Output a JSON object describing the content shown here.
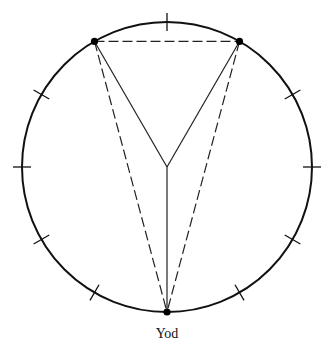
{
  "diagram": {
    "type": "circle-with-inscribed-yod",
    "circle": {
      "cx": 167,
      "cy": 167,
      "r": 145,
      "stroke": "#111111"
    },
    "tick_marks_degrees_from_top": [
      0,
      60,
      90,
      120,
      150,
      210,
      240,
      270,
      300
    ],
    "points": [
      {
        "id": "left-vertex",
        "angle_from_top": -30
      },
      {
        "id": "right-vertex",
        "angle_from_top": 30
      },
      {
        "id": "bottom-vertex",
        "angle_from_top": 180,
        "label": "Yod"
      }
    ],
    "solid_lines": [
      [
        "left-vertex",
        "center"
      ],
      [
        "right-vertex",
        "center"
      ],
      [
        "center",
        "bottom-vertex"
      ]
    ],
    "dashed_lines": [
      [
        "left-vertex",
        "right-vertex"
      ],
      [
        "left-vertex",
        "bottom-vertex"
      ],
      [
        "right-vertex",
        "bottom-vertex"
      ]
    ],
    "label_text": "Yod"
  }
}
